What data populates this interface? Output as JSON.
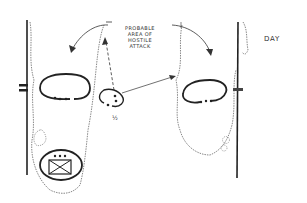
{
  "diagram": {
    "annotation_lines": [
      "PROBABLE",
      "AREA OF",
      "HOSTILE",
      "ATTACK"
    ],
    "period_label": "DAY",
    "unit_fraction_label": "½",
    "colors": {
      "ink": "#222222",
      "background": "#ffffff",
      "treeline": "#555555"
    }
  }
}
